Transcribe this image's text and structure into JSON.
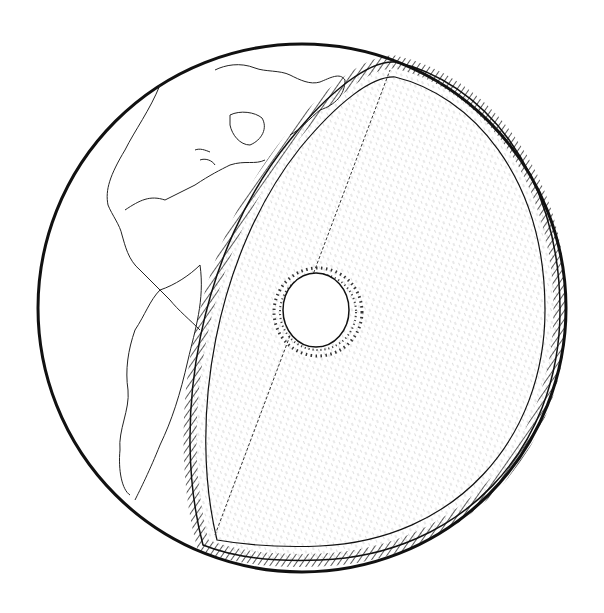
{
  "illustration": {
    "subject": "Cutaway globe showing Earth's interior layers",
    "colors": {
      "ink": "#111111",
      "background": "#ffffff"
    },
    "layers": [
      "crust",
      "mantle",
      "outer-core",
      "inner-core"
    ],
    "visible_continents": [
      "North America",
      "South America",
      "Greenland"
    ]
  }
}
